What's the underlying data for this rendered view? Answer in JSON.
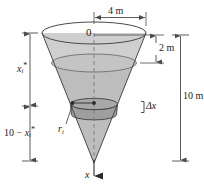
{
  "figure": {
    "labels": {
      "top_diameter": "4 m",
      "freeboard": "2 m",
      "total_depth": "10 m",
      "origin": "0",
      "axis": "x",
      "slab_thickness": "Δx",
      "disk_radius_base": "r",
      "disk_radius_sub": "i",
      "depth_to_slab_base": "x",
      "depth_to_slab_sub": "i",
      "depth_to_slab_star": "*",
      "remaining_lift_prefix": "10 − ",
      "remaining_lift_base": "x",
      "remaining_lift_sub": "i",
      "remaining_lift_star": "*"
    },
    "colors": {
      "outline": "#3a3a3a",
      "water_fill": "#b9b9b9",
      "cone_fill": "#d8d8d8",
      "slab_fill": "#9a9a9a",
      "dimension_line": "#4a4a4a",
      "background": "#ffffff"
    },
    "geometry": {
      "cone_top_rim_y": 33,
      "cone_apex_y": 163,
      "cone_left_x": 42,
      "cone_right_x": 146,
      "center_x": 94,
      "water_surface_y": 63,
      "slab_top_y": 104,
      "slab_bottom_y": 115,
      "top_radius_m": 4,
      "depth_m": 10,
      "freeboard_m": 2
    }
  }
}
